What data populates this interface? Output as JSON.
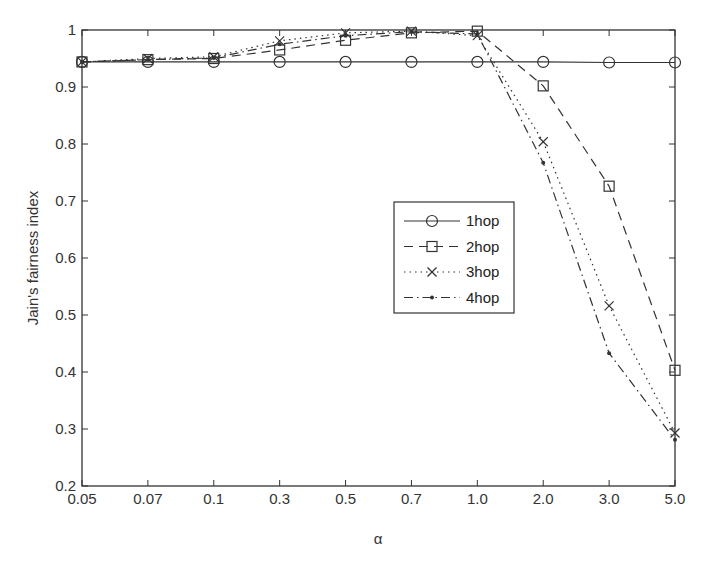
{
  "chart_data": {
    "type": "line",
    "title": "",
    "xlabel": "α",
    "ylabel": "Jain's fairness index",
    "categories": [
      "0.05",
      "0.07",
      "0.1",
      "0.3",
      "0.5",
      "0.7",
      "1.0",
      "2.0",
      "3.0",
      "5.0"
    ],
    "ylim": [
      0.2,
      1.0
    ],
    "yticks": [
      "0.2",
      "0.3",
      "0.4",
      "0.5",
      "0.6",
      "0.7",
      "0.8",
      "0.9",
      "1"
    ],
    "grid": false,
    "legend_position": "center-right (inside plot)",
    "series": [
      {
        "name": "1hop",
        "line": "solid",
        "marker": "circle",
        "values": [
          0.944,
          0.944,
          0.944,
          0.944,
          0.944,
          0.944,
          0.944,
          0.944,
          0.943,
          0.943
        ]
      },
      {
        "name": "2hop",
        "line": "dashed",
        "marker": "square",
        "values": [
          0.944,
          0.948,
          0.95,
          0.965,
          0.982,
          0.995,
          0.998,
          0.902,
          0.726,
          0.403
        ]
      },
      {
        "name": "3hop",
        "line": "dotted",
        "marker": "x",
        "values": [
          0.944,
          0.95,
          0.953,
          0.981,
          0.995,
          0.998,
          0.99,
          0.804,
          0.516,
          0.293
        ]
      },
      {
        "name": "4hop",
        "line": "dashdot",
        "marker": "dot",
        "values": [
          0.944,
          0.948,
          0.951,
          0.975,
          0.99,
          0.997,
          0.993,
          0.767,
          0.433,
          0.281
        ]
      }
    ]
  },
  "legend": {
    "items": [
      "1hop",
      "2hop",
      "3hop",
      "4hop"
    ]
  },
  "axes": {
    "xlabel": "α",
    "ylabel": "Jain's fairness index"
  }
}
